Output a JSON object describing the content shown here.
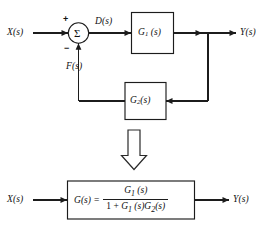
{
  "figure": {
    "background_color": "#ffffff",
    "line_color": "#1c1c1c"
  },
  "top_diagram": {
    "name": "feedback-block-diagram",
    "input_label": "X(s)",
    "output_label": "Y(s)",
    "error_label": "D(s)",
    "feedback_label": "F(s)",
    "summing_junction": {
      "symbol": "Σ",
      "plus_sign": "+",
      "minus_sign": "−"
    },
    "forward_block": {
      "label_main": "G",
      "label_sub": "1",
      "label_arg": "(s)"
    },
    "feedback_block": {
      "label_main": "G",
      "label_sub": "2",
      "label_arg": "(s)"
    }
  },
  "transition": {
    "arrow_name": "downward-double-arrow",
    "direction": "down"
  },
  "bottom_diagram": {
    "name": "equivalent-transfer-function",
    "input_label": "X(s)",
    "output_label": "Y(s)",
    "equation": {
      "lhs_main": "G",
      "lhs_arg": "(s)",
      "equals": "=",
      "numerator": {
        "main": "G",
        "sub": "1",
        "arg": "(s)"
      },
      "denominator": {
        "one": "1",
        "plus": "+",
        "term1_main": "G",
        "term1_sub": "1",
        "term1_arg": "(s)",
        "term2_main": "G",
        "term2_sub": "2",
        "term2_arg": "(s)"
      }
    }
  }
}
